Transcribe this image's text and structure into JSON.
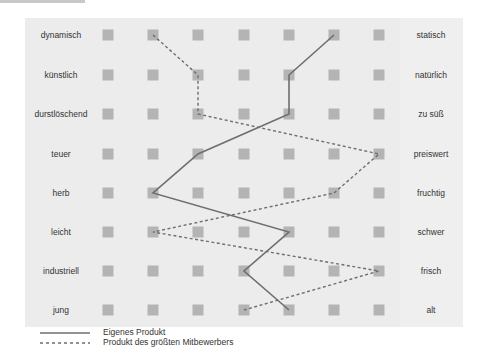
{
  "chart_data": {
    "type": "line",
    "title": "",
    "chart_subtype": "semantic differential / polarity profile",
    "scale_points": 7,
    "left_labels": [
      "dynamisch",
      "künstlich",
      "durstlöschend",
      "teuer",
      "herb",
      "leicht",
      "industriell",
      "jung"
    ],
    "right_labels": [
      "statisch",
      "natürlich",
      "zu süß",
      "preiswert",
      "fruchtig",
      "schwer",
      "frisch",
      "alt"
    ],
    "series": [
      {
        "name": "Eigenes Produkt",
        "style": "solid",
        "values": [
          6,
          5,
          5,
          3,
          2,
          5,
          4,
          5
        ]
      },
      {
        "name": "Produkt des größten Mitbewerbers",
        "style": "dashed",
        "values": [
          2,
          3,
          3,
          7,
          6,
          2,
          7,
          4
        ]
      }
    ],
    "legend_position": "bottom-left",
    "grid": false
  },
  "legend": {
    "own": "Eigenes Produkt",
    "competitor": "Produkt des größten Mitbewerbers"
  },
  "colors": {
    "panel": "#ececec",
    "marker": "#b4b4b4",
    "line": "#6e6e6e"
  }
}
